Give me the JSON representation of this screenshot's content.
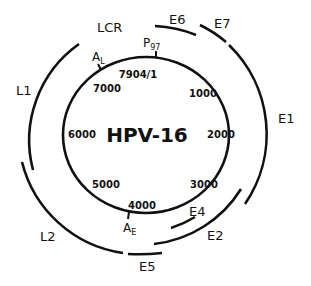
{
  "diagram": {
    "title": "HPV-16",
    "genome_positions": [
      {
        "label": "7904/1",
        "x": 137,
        "y": 77
      },
      {
        "label": "1000",
        "x": 203,
        "y": 96
      },
      {
        "label": "2000",
        "x": 222,
        "y": 137
      },
      {
        "label": "3000",
        "x": 205,
        "y": 187
      },
      {
        "label": "4000",
        "x": 141,
        "y": 208
      },
      {
        "label": "5000",
        "x": 107,
        "y": 187
      },
      {
        "label": "6000",
        "x": 89,
        "y": 137
      },
      {
        "label": "7000",
        "x": 108,
        "y": 91
      }
    ],
    "markers": {
      "p97": {
        "main": "P",
        "sub": "97"
      },
      "al": {
        "main": "A",
        "sub": "L"
      },
      "ae": {
        "main": "A",
        "sub": "E"
      }
    },
    "regions": {
      "lcr": "LCR",
      "e6": "E6",
      "e7": "E7",
      "e1": "E1",
      "e2": "E2",
      "e4": "E4",
      "e5": "E5",
      "l1": "L1",
      "l2": "L2"
    },
    "stroke_color": "#111111",
    "background_color": "#ffffff"
  }
}
